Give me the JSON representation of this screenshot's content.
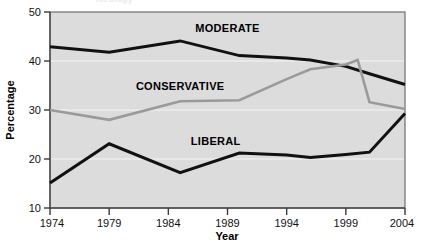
{
  "figure": {
    "clipped_title": "ideology",
    "background_color": "#ffffff",
    "plot_background_color": "#dcdcdc",
    "plot_border_color": "#666666"
  },
  "chart_data": {
    "type": "line",
    "title": "",
    "xlabel": "Year",
    "ylabel": "Percentage",
    "xlim": [
      1974,
      2004
    ],
    "ylim": [
      10,
      50
    ],
    "xticks": [
      1974,
      1979,
      1984,
      1989,
      1994,
      1999,
      2004
    ],
    "xtick_labels": [
      "1974",
      "1979",
      "1984",
      "1989",
      "1994",
      "1999",
      "2004"
    ],
    "yticks": [
      10,
      20,
      30,
      40,
      50
    ],
    "ytick_labels": [
      "10",
      "20",
      "30",
      "40",
      "50"
    ],
    "grid": "horizontal-light",
    "legend": "inline-labels",
    "series": [
      {
        "name": "MODERATE",
        "color": "#111111",
        "label_x": 1989,
        "label_y": 46.8,
        "x": [
          1974,
          1979,
          1985,
          1990,
          1994,
          1996,
          1999,
          2001,
          2004
        ],
        "values": [
          42.9,
          41.8,
          44.1,
          41.1,
          40.6,
          40.2,
          38.9,
          37.4,
          35.2
        ]
      },
      {
        "name": "CONSERVATIVE",
        "color": "#9a9a9a",
        "label_x": 1985,
        "label_y": 35.0,
        "x": [
          1974,
          1979,
          1985,
          1990,
          1994,
          1996,
          1999,
          2000,
          2001,
          2004
        ],
        "values": [
          30.0,
          28.0,
          31.8,
          32.0,
          36.3,
          38.3,
          39.3,
          40.2,
          31.6,
          30.2
        ]
      },
      {
        "name": "LIBERAL",
        "color": "#111111",
        "label_x": 1988,
        "label_y": 23.6,
        "x": [
          1974,
          1979,
          1985,
          1990,
          1994,
          1996,
          1999,
          2001,
          2004
        ],
        "values": [
          15.1,
          23.1,
          17.2,
          21.2,
          20.8,
          20.3,
          20.9,
          21.4,
          29.3
        ]
      }
    ]
  }
}
